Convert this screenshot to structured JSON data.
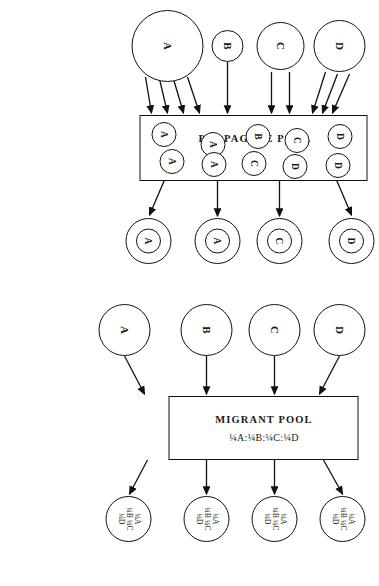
{
  "figure": {
    "caption": "Figure 1. The diagram illustrates the differences between the concepts of a migrant pool and a propagule pool. See text for further explanation."
  },
  "propagule_panel": {
    "pool_title": "PROPAGULE POOL",
    "sources": [
      {
        "label": "D",
        "size": 52,
        "arrows": 3
      },
      {
        "label": "C",
        "size": 48,
        "arrows": 2
      },
      {
        "label": "B",
        "size": 32,
        "arrows": 1
      },
      {
        "label": "A",
        "size": 72,
        "arrows": 4
      }
    ],
    "pool_contents_left": [
      "D",
      "C",
      "B",
      "A",
      "A"
    ],
    "pool_contents_right": [
      "D",
      "D",
      "C",
      "A",
      "A"
    ],
    "outputs": [
      "D",
      "C",
      "A",
      "A"
    ]
  },
  "migrant_panel": {
    "pool_title": "MIGRANT POOL",
    "pool_ratio": "¼A:¼B:¼C:¼D",
    "sources": [
      {
        "label": "D",
        "size": 52,
        "arrows": 1
      },
      {
        "label": "C",
        "size": 52,
        "arrows": 1
      },
      {
        "label": "B",
        "size": 52,
        "arrows": 1
      },
      {
        "label": "A",
        "size": 52,
        "arrows": 1
      }
    ],
    "outputs": [
      {
        "line1": "¼A",
        "line2": "¼B ¼C",
        "line3": "¼D"
      },
      {
        "line1": "¼A",
        "line2": "¼B ¼C",
        "line3": "¼D"
      },
      {
        "line1": "¼A",
        "line2": "¼B ¼C",
        "line3": "¼D"
      },
      {
        "line1": "¼A",
        "line2": "¼B ¼C",
        "line3": "¼D"
      }
    ]
  },
  "colors": {
    "ink": "#111111",
    "paper": "#ffffff"
  }
}
